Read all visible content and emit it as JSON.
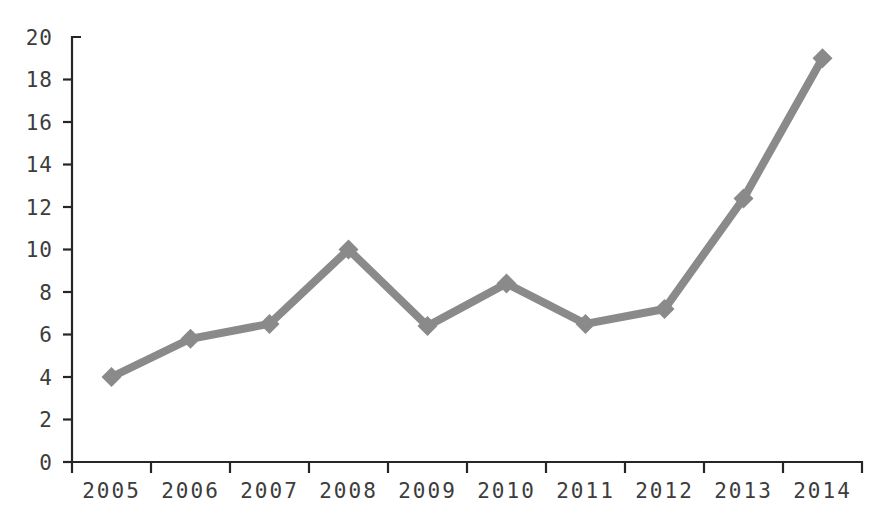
{
  "chart_data": {
    "type": "line",
    "title": "",
    "subtitle": "",
    "xlabel": "",
    "ylabel": "",
    "categories": [
      "2005",
      "2006",
      "2007",
      "2008",
      "2009",
      "2010",
      "2011",
      "2012",
      "2013",
      "2014"
    ],
    "values": [
      4.0,
      5.8,
      6.5,
      10.0,
      6.4,
      8.4,
      6.5,
      7.2,
      12.4,
      19.0
    ],
    "series": [
      {
        "name": "series-1",
        "values": [
          4.0,
          5.8,
          6.5,
          10.0,
          6.4,
          8.4,
          6.5,
          7.2,
          12.4,
          19.0
        ],
        "color": "#8a8a8a",
        "marker": "diamond",
        "line_width": 8,
        "marker_size": 20
      }
    ],
    "ylim": [
      0,
      20
    ],
    "yticks": [
      0,
      2,
      4,
      6,
      8,
      10,
      12,
      14,
      16,
      18,
      20
    ],
    "ytick_labels": [
      "0",
      "2",
      "4",
      "6",
      "8",
      "10",
      "12",
      "14",
      "16",
      "18",
      "20"
    ],
    "xtick_labels": [
      "2005",
      "2006",
      "2007",
      "2008",
      "2009",
      "2010",
      "2011",
      "2012",
      "2013",
      "2014"
    ],
    "grid": false,
    "legend": false,
    "legend_position": "none",
    "background_color": "#ffffff",
    "axis_color": "#262626",
    "tick_label_color": "#3d3d3d",
    "series_color": "#8a8a8a"
  }
}
